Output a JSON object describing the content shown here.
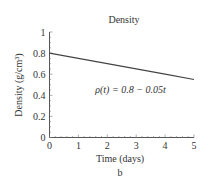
{
  "chart_data": {
    "type": "line",
    "title": "Density",
    "xlabel": "Time (days)",
    "ylabel": "Density (g/cm³)",
    "caption": "b",
    "xlim": [
      0,
      5
    ],
    "ylim": [
      0,
      1
    ],
    "x_ticks": [
      "0",
      "1",
      "2",
      "3",
      "4",
      "5"
    ],
    "y_ticks": [
      "0",
      "0.2",
      "0.4",
      "0.6",
      "0.8",
      "1"
    ],
    "grid": false,
    "series": [
      {
        "name": "ρ(t) = 0.8 − 0.05t",
        "x": [
          0,
          1,
          2,
          3,
          4,
          5
        ],
        "values": [
          0.8,
          0.75,
          0.7,
          0.65,
          0.6,
          0.55
        ]
      }
    ],
    "annotations": [
      {
        "text": "ρ(t) = 0.8 − 0.05t",
        "x": 2.8,
        "y": 0.45
      }
    ],
    "line_color": "#444444"
  }
}
